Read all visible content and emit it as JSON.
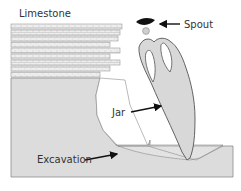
{
  "diagram": {
    "labels": {
      "limestone": "Limestone",
      "spout": "Spout",
      "jar": "Jar",
      "excavation": "Excavation"
    },
    "strata_count": 9,
    "colors": {
      "rock_fill": "#dcdcdc",
      "rock_stroke": "#8c8c8c",
      "stratum_fill": "#ececec",
      "jar_fill": "#d8d8d8",
      "spout_fill": "#111111",
      "excavation_fill": "#e6e6e6",
      "arrow": "#111111",
      "text": "#333333"
    }
  }
}
